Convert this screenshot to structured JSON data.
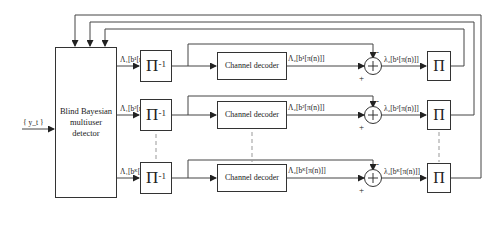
{
  "input": {
    "label": "{ y_t }"
  },
  "detector": {
    "label": "Blind Bayesian multiuser detector"
  },
  "rows": [
    {
      "detector_output": "Λ₁[b¹[n]]",
      "deinterleaver": "Π",
      "deinterleaver_sup": "-1",
      "decoder": "Channel decoder",
      "decoder_output": "Λ₂[b¹[π(n)]]",
      "extrinsic": "λ₂[b¹[π(n)]]",
      "interleaver": "Π"
    },
    {
      "detector_output": "Λ₁[b²[n]]",
      "deinterleaver": "Π",
      "deinterleaver_sup": "-1",
      "decoder": "Channel decoder",
      "decoder_output": "Λ₂[b²[π(n)]]",
      "extrinsic": "λ₂[b²[π(n)]]",
      "interleaver": "Π"
    },
    {
      "detector_output": "Λ₁[bᴷ[n]]",
      "deinterleaver": "Π",
      "deinterleaver_sup": "-1",
      "decoder": "Channel decoder",
      "decoder_output": "Λ₂[bᴷ[π(n)]]",
      "extrinsic": "λ₂[bᴷ[π(n)]]",
      "interleaver": "Π"
    }
  ],
  "adder": {
    "symbol": "+",
    "plus_sign": "+",
    "minus_sign": "-"
  }
}
